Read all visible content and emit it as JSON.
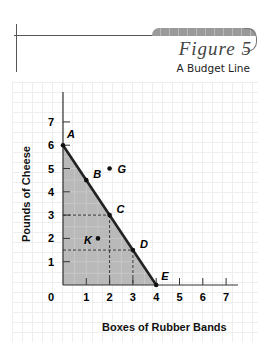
{
  "figure": {
    "title": "Figure 5",
    "subtitle": "A Budget Line"
  },
  "chart_data": {
    "type": "line",
    "title": "A Budget Line",
    "xlabel": "Boxes of Rubber Bands",
    "ylabel": "Pounds of Cheese",
    "xlim": [
      0,
      7
    ],
    "ylim": [
      0,
      7
    ],
    "x_ticks": [
      "0",
      "1",
      "2",
      "3",
      "4",
      "5",
      "6",
      "7"
    ],
    "y_ticks": [
      "1",
      "2",
      "3",
      "4",
      "5",
      "6",
      "7"
    ],
    "series": [
      {
        "name": "Budget line",
        "x": [
          0,
          4
        ],
        "y": [
          6,
          0
        ]
      }
    ],
    "shaded_region": "affordable set under budget line (triangle 0,0 - 0,6 - 4,0)",
    "points": [
      {
        "label": "A",
        "x": 0,
        "y": 6
      },
      {
        "label": "B",
        "x": 1,
        "y": 4.5
      },
      {
        "label": "C",
        "x": 2,
        "y": 3
      },
      {
        "label": "D",
        "x": 3,
        "y": 1.5
      },
      {
        "label": "E",
        "x": 4,
        "y": 0
      },
      {
        "label": "G",
        "x": 2,
        "y": 5
      },
      {
        "label": "K",
        "x": 1.5,
        "y": 2
      }
    ],
    "dashed_guides": [
      {
        "from": [
          0,
          3
        ],
        "to": [
          2,
          3
        ]
      },
      {
        "from": [
          2,
          3
        ],
        "to": [
          2,
          0
        ]
      },
      {
        "from": [
          0,
          1.5
        ],
        "to": [
          3,
          1.5
        ]
      },
      {
        "from": [
          3,
          1.5
        ],
        "to": [
          3,
          0
        ]
      }
    ],
    "grid": false
  }
}
